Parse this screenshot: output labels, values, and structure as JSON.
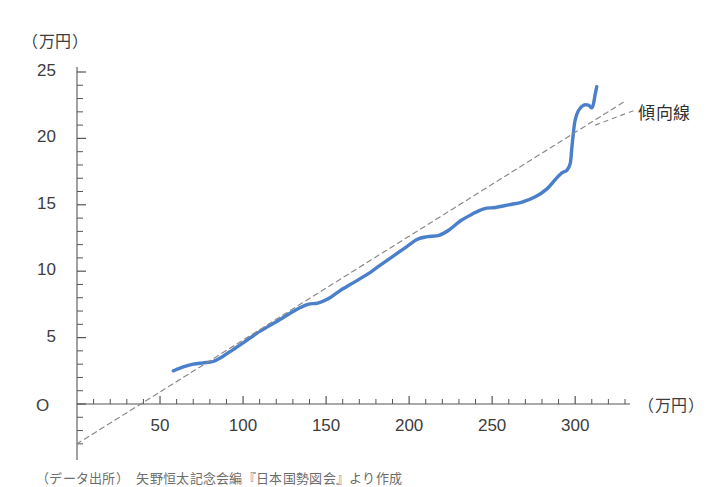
{
  "chart_data": {
    "type": "line",
    "title": "",
    "subtitle": "",
    "xlabel": "（万円）",
    "ylabel": "（万円）",
    "xlim": [
      0,
      330
    ],
    "ylim": [
      -3,
      25.8
    ],
    "grid": false,
    "legend_position": "inline-annotation",
    "x_ticks_major": [
      50,
      100,
      150,
      200,
      250,
      300
    ],
    "x_tick_labels": [
      "50",
      "100",
      "150",
      "200",
      "250",
      "300"
    ],
    "x_tick_minor_step": 10,
    "y_ticks_major": [
      0,
      5,
      10,
      15,
      20,
      25
    ],
    "y_tick_labels": [
      "O",
      "5",
      "10",
      "15",
      "20",
      "25"
    ],
    "y_tick_minor_step": 1,
    "origin_label": "O",
    "annotations": [
      {
        "text": "傾向線",
        "x": 318,
        "y": 22.3,
        "target": "trend-line"
      }
    ],
    "series": [
      {
        "name": "実績曲線",
        "type": "line",
        "color": "#4a7fc9",
        "style": "solid",
        "width": 3.4,
        "points": [
          [
            58,
            2.5
          ],
          [
            64,
            2.8
          ],
          [
            70,
            3.0
          ],
          [
            76,
            3.1
          ],
          [
            82,
            3.2
          ],
          [
            88,
            3.6
          ],
          [
            94,
            4.1
          ],
          [
            100,
            4.6
          ],
          [
            108,
            5.3
          ],
          [
            116,
            5.9
          ],
          [
            124,
            6.5
          ],
          [
            132,
            7.1
          ],
          [
            139,
            7.5
          ],
          [
            145,
            7.6
          ],
          [
            151,
            7.9
          ],
          [
            158,
            8.5
          ],
          [
            166,
            9.1
          ],
          [
            174,
            9.7
          ],
          [
            182,
            10.4
          ],
          [
            190,
            11.1
          ],
          [
            198,
            11.8
          ],
          [
            205,
            12.4
          ],
          [
            211,
            12.6
          ],
          [
            218,
            12.7
          ],
          [
            224,
            13.1
          ],
          [
            231,
            13.8
          ],
          [
            238,
            14.3
          ],
          [
            245,
            14.7
          ],
          [
            252,
            14.8
          ],
          [
            260,
            15.0
          ],
          [
            268,
            15.2
          ],
          [
            276,
            15.6
          ],
          [
            283,
            16.2
          ],
          [
            288,
            16.9
          ],
          [
            292,
            17.4
          ],
          [
            295,
            17.6
          ],
          [
            297,
            18.1
          ],
          [
            298,
            19.3
          ],
          [
            299,
            20.5
          ],
          [
            300,
            21.4
          ],
          [
            302,
            22.1
          ],
          [
            305,
            22.5
          ],
          [
            308,
            22.5
          ],
          [
            310,
            22.3
          ],
          [
            311,
            22.6
          ],
          [
            312,
            23.3
          ],
          [
            313,
            23.9
          ]
        ]
      },
      {
        "name": "傾向線",
        "type": "line",
        "color": "#8a8a8a",
        "style": "dashed",
        "width": 1.2,
        "points": [
          [
            0,
            -3.0
          ],
          [
            330,
            22.8
          ]
        ]
      }
    ]
  },
  "axis": {
    "y_unit": "（万円）",
    "x_unit": "（万円）"
  },
  "caption": {
    "source": "（データ出所）　矢野恒太記念会編『日本国勢図会』より作成"
  },
  "colors": {
    "series_blue": "#4a7fc9",
    "trend_gray": "#8a8a8a",
    "axis": "#555555",
    "text": "#3d3d3d"
  }
}
